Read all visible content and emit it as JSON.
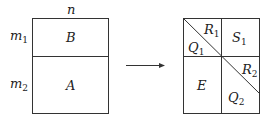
{
  "left_matrix": {
    "top_label": "n",
    "row_labels": [
      {
        "base": "m",
        "sub": "1"
      },
      {
        "base": "m",
        "sub": "2"
      }
    ],
    "blocks": [
      {
        "base": "B",
        "sub": ""
      },
      {
        "base": "A",
        "sub": ""
      }
    ]
  },
  "arrow": {
    "direction": "right"
  },
  "right_matrix": {
    "blocks": [
      {
        "base": "R",
        "sub": "1"
      },
      {
        "base": "Q",
        "sub": "1"
      },
      {
        "base": "S",
        "sub": "1"
      },
      {
        "base": "E",
        "sub": ""
      },
      {
        "base": "R",
        "sub": "2"
      },
      {
        "base": "Q",
        "sub": "2"
      }
    ]
  }
}
